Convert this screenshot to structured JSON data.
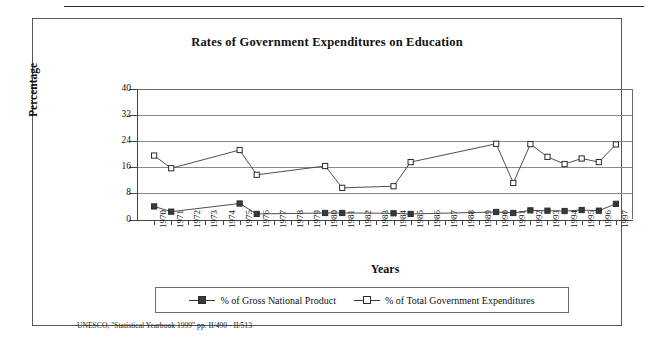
{
  "figure": {
    "title": "Rates of Government Expenditures on Education",
    "source_note": "UNESCO, \"Statistical Yearbook 1999\" pp. II/490 - II/513"
  },
  "chart_data": {
    "type": "line",
    "title": "Rates of Government Expenditures on Education",
    "xlabel": "Years",
    "ylabel": "Percentage",
    "ylim": [
      0,
      40
    ],
    "yticks": [
      0,
      8,
      16,
      24,
      32,
      40
    ],
    "grid": true,
    "legend_position": "bottom",
    "categories": [
      "1970",
      "1971",
      "1972",
      "1973",
      "1974",
      "1975",
      "1976",
      "1977",
      "1978",
      "1979",
      "1980",
      "1981",
      "1982",
      "1983",
      "1984",
      "1985",
      "1986",
      "1987",
      "1988",
      "1989",
      "1990",
      "1991",
      "1992",
      "1993",
      "1994",
      "1995",
      "1996",
      "1997"
    ],
    "series": [
      {
        "name": "% of Gross National Product",
        "marker": "filled-square",
        "values": [
          4.0,
          2.4,
          null,
          null,
          null,
          4.9,
          1.7,
          null,
          null,
          null,
          2.0,
          2.0,
          null,
          null,
          1.9,
          1.7,
          null,
          null,
          null,
          null,
          2.3,
          2.0,
          2.8,
          2.7,
          2.6,
          2.9,
          2.7,
          4.8
        ]
      },
      {
        "name": "% of Total Government Expenditures",
        "marker": "open-square",
        "values": [
          19.6,
          15.7,
          null,
          null,
          null,
          21.3,
          13.7,
          null,
          null,
          null,
          16.4,
          9.7,
          null,
          null,
          10.2,
          17.6,
          null,
          null,
          null,
          null,
          23.2,
          11.2,
          23.1,
          19.2,
          17.0,
          18.7,
          17.6,
          23.0
        ]
      }
    ]
  },
  "legend": {
    "items": [
      {
        "label": "% of Gross National Product",
        "marker": "filled-square"
      },
      {
        "label": "% of Total Government Expenditures",
        "marker": "open-square"
      }
    ]
  },
  "colors": {
    "line": "#3a3a3a",
    "grid": "#8a8a8a",
    "axis": "#444444",
    "text": "#111111"
  }
}
